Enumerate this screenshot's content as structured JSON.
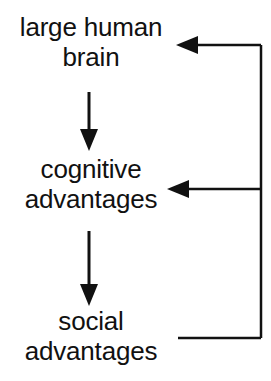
{
  "diagram": {
    "stroke_color": "#111111",
    "background_color": "#ffffff",
    "nodes": [
      {
        "id": "brain",
        "line1": "large human",
        "line2": "brain"
      },
      {
        "id": "cognitive",
        "line1": "cognitive",
        "line2": "advantages"
      },
      {
        "id": "social",
        "line1": "social",
        "line2": "advantages"
      }
    ],
    "edges": [
      {
        "id": "brain-to-cognitive",
        "from": "brain",
        "to": "cognitive",
        "direction": "down",
        "arrowhead": "filled-triangle"
      },
      {
        "id": "cognitive-to-social",
        "from": "cognitive",
        "to": "social",
        "direction": "down",
        "arrowhead": "filled-triangle"
      },
      {
        "id": "social-to-cognitive-feedback",
        "from": "social",
        "to": "cognitive",
        "direction": "left",
        "arrowhead": "filled-triangle"
      },
      {
        "id": "social-to-brain-feedback",
        "from": "social",
        "to": "brain",
        "direction": "left",
        "arrowhead": "filled-triangle"
      }
    ]
  }
}
